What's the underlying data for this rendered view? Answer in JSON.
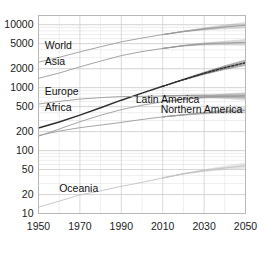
{
  "chart_data": {
    "type": "line",
    "title": "",
    "subtitle": "",
    "xlabel": "",
    "ylabel": "",
    "yscale": "log",
    "xlim": [
      1950,
      2050
    ],
    "ylim": [
      10,
      14000
    ],
    "grid": true,
    "legend_position": "inline-labels",
    "yticks": [
      10,
      20,
      50,
      100,
      200,
      500,
      1000,
      2000,
      5000,
      10000
    ],
    "ytick_labels": [
      "10",
      "20",
      "50",
      "100",
      "200",
      "500",
      "1000",
      "2000",
      "5000",
      "10000"
    ],
    "xticks": [
      1950,
      1970,
      1990,
      2010,
      2030,
      2050
    ],
    "xtick_labels": [
      "1950",
      "1970",
      "1990",
      "2010",
      "2030",
      "2050"
    ],
    "x": [
      1950,
      1960,
      1970,
      1980,
      1990,
      2000,
      2010,
      2020,
      2030,
      2040,
      2050
    ],
    "projection_start": 2010,
    "annotations": [
      {
        "text": "World",
        "x": 1953,
        "y": 4100
      },
      {
        "text": "Asia",
        "x": 1953,
        "y": 2300
      },
      {
        "text": "Europe",
        "x": 1953,
        "y": 760
      },
      {
        "text": "Africa",
        "x": 1953,
        "y": 430
      },
      {
        "text": "Latin America",
        "x": 1997,
        "y": 560
      },
      {
        "text": "Northern America",
        "x": 2009,
        "y": 390
      },
      {
        "text": "Oceania",
        "x": 1960,
        "y": 22
      }
    ],
    "series": [
      {
        "name": "World",
        "color": "#9a9a9a",
        "style": "solid",
        "values": [
          2536,
          3035,
          3700,
          4458,
          5331,
          6144,
          6957,
          7795,
          8551,
          9210,
          9772
        ],
        "band_low": [
          2536,
          3035,
          3700,
          4458,
          5331,
          6144,
          6957,
          7700,
          8250,
          8600,
          8800
        ],
        "band_high": [
          2536,
          3035,
          3700,
          4458,
          5331,
          6144,
          6957,
          7890,
          8880,
          9880,
          10900
        ]
      },
      {
        "name": "Asia",
        "color": "#9a9a9a",
        "style": "solid",
        "values": [
          1405,
          1705,
          2140,
          2642,
          3226,
          3741,
          4194,
          4641,
          4947,
          5100,
          5257
        ],
        "band_low": [
          1405,
          1705,
          2140,
          2642,
          3226,
          3741,
          4194,
          4580,
          4760,
          4760,
          4700
        ],
        "band_high": [
          1405,
          1705,
          2140,
          2642,
          3226,
          3741,
          4194,
          4700,
          5140,
          5460,
          5830
        ]
      },
      {
        "name": "Africa",
        "color": "#2e2e2e",
        "style": "solid-then-dashed",
        "values": [
          228,
          285,
          366,
          478,
          632,
          818,
          1049,
          1341,
          1688,
          2077,
          2489
        ],
        "band_low": [
          228,
          285,
          366,
          478,
          632,
          818,
          1049,
          1320,
          1620,
          1940,
          2240
        ],
        "band_high": [
          228,
          285,
          366,
          478,
          632,
          818,
          1049,
          1362,
          1760,
          2230,
          2760
        ]
      },
      {
        "name": "Europe",
        "color": "#9a9a9a",
        "style": "solid",
        "values": [
          549,
          605,
          657,
          694,
          721,
          726,
          736,
          748,
          741,
          728,
          710
        ],
        "band_low": [
          549,
          605,
          657,
          694,
          721,
          726,
          736,
          740,
          710,
          670,
          630
        ],
        "band_high": [
          549,
          605,
          657,
          694,
          721,
          726,
          736,
          757,
          775,
          790,
          800
        ]
      },
      {
        "name": "Latin America",
        "color": "#9a9a9a",
        "style": "solid",
        "values": [
          169,
          220,
          287,
          364,
          447,
          526,
          596,
          654,
          706,
          734,
          751
        ],
        "band_low": [
          169,
          220,
          287,
          364,
          447,
          526,
          596,
          648,
          681,
          686,
          676
        ],
        "band_high": [
          169,
          220,
          287,
          364,
          447,
          526,
          596,
          661,
          733,
          789,
          838
        ]
      },
      {
        "name": "Northern America",
        "color": "#9a9a9a",
        "style": "solid",
        "values": [
          173,
          204,
          231,
          254,
          280,
          312,
          343,
          369,
          395,
          417,
          435
        ],
        "band_low": [
          173,
          204,
          231,
          254,
          280,
          312,
          343,
          366,
          382,
          391,
          394
        ],
        "band_high": [
          173,
          204,
          231,
          254,
          280,
          312,
          343,
          373,
          409,
          445,
          480
        ]
      },
      {
        "name": "Oceania",
        "color": "#c2c2c2",
        "style": "solid",
        "values": [
          12.6,
          15.7,
          19.7,
          22.9,
          27.0,
          31.2,
          36.7,
          42.7,
          48.1,
          52.8,
          57.4
        ],
        "band_low": [
          12.6,
          15.7,
          19.7,
          22.9,
          27.0,
          31.2,
          36.7,
          42.3,
          46.6,
          49.6,
          51.6
        ],
        "band_high": [
          12.6,
          15.7,
          19.7,
          22.9,
          27.0,
          31.2,
          36.7,
          43.1,
          49.7,
          56.2,
          63.5
        ]
      }
    ]
  }
}
